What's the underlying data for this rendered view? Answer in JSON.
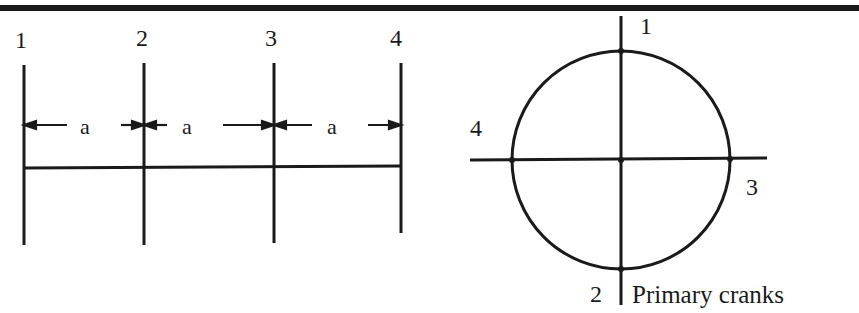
{
  "diagram": {
    "crank_layout": {
      "crank_labels": [
        "1",
        "2",
        "3",
        "4"
      ],
      "spacing_labels": [
        "a",
        "a",
        "a"
      ]
    },
    "crank_circle": {
      "top_label": "1",
      "bottom_label": "2",
      "right_label": "3",
      "left_label": "4",
      "caption": "Primary cranks"
    },
    "colors": {
      "ink": "#1a1a1a",
      "background": "#ffffff"
    }
  }
}
